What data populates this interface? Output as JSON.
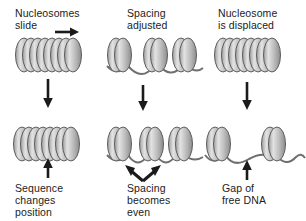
{
  "figure": {
    "background_color": "#ffffff",
    "ink_color": "#1b1b1b",
    "nucleosome_fill_light": "#d9d9d9",
    "nucleosome_fill_mid": "#b3b3b3",
    "nucleosome_fill_dark": "#8a8a8a",
    "dna_color": "#6f6f6f"
  },
  "panels": [
    {
      "id": "slide",
      "caption_top": "Nucleosomes\nslide",
      "caption_bottom": "Sequence\nchanges\nposition",
      "transition_arrow": "down-arrow",
      "motion_arrow": "right-arrow",
      "callout_arrow": "up-arrow",
      "top_state": {
        "description": "continuous evenly packed nucleosome array",
        "clusters": [
          8
        ]
      },
      "bottom_state": {
        "description": "continuous array shifted along the DNA",
        "clusters": [
          8
        ]
      }
    },
    {
      "id": "spacing",
      "caption_top": "Spacing\nadjusted",
      "caption_bottom": "Spacing\nbecomes\neven",
      "transition_arrow": "down-arrow",
      "callout_arrow": "double-up-arrow",
      "top_state": {
        "description": "three nucleosome clusters with uneven linker DNA",
        "clusters": [
          2,
          2,
          2
        ]
      },
      "bottom_state": {
        "description": "three nucleosome clusters with even linker DNA",
        "clusters": [
          2,
          2,
          2
        ]
      }
    },
    {
      "id": "displace",
      "caption_top": "Nucleosome\nis displaced",
      "caption_bottom": "Gap of\nfree DNA",
      "transition_arrow": "down-arrow",
      "callout_arrow": "up-arrow",
      "top_state": {
        "description": "continuous evenly packed nucleosome array",
        "clusters": [
          8
        ]
      },
      "bottom_state": {
        "description": "two nucleosome clusters separated by bare DNA",
        "clusters": [
          2,
          2
        ]
      }
    }
  ]
}
